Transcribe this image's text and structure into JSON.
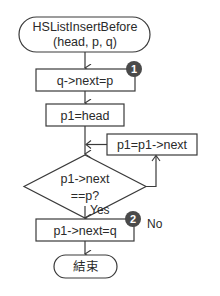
{
  "flowchart": {
    "start": {
      "line1": "HSListInsertBefore",
      "line2": "(head, p, q)"
    },
    "step1": {
      "label": "q->next=p",
      "badge": "1"
    },
    "step2": {
      "label": "p1=head"
    },
    "loop_step": {
      "label": "p1=p1->next"
    },
    "decision": {
      "line1": "p1->next",
      "line2": "==p?",
      "no_label": "No",
      "yes_label": "Yes"
    },
    "step3": {
      "label": "p1->next=q",
      "badge": "2"
    },
    "end": {
      "label": "結束"
    }
  },
  "colors": {
    "stroke": "#3a3a3a",
    "badge": "#4a4a4a",
    "text": "#2a2a2a",
    "background": "#ffffff"
  }
}
